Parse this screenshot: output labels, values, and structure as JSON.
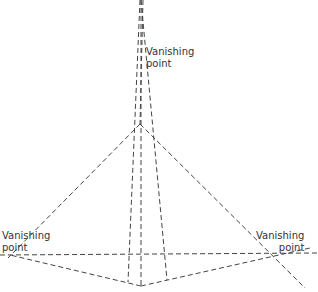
{
  "labels": {
    "top": "Vanishing\npoint",
    "left": "Vanishing\npoint",
    "right": "Vanishing\npoint"
  },
  "colors": {
    "line": "#444444",
    "text": "#333333",
    "background": "#ffffff"
  }
}
